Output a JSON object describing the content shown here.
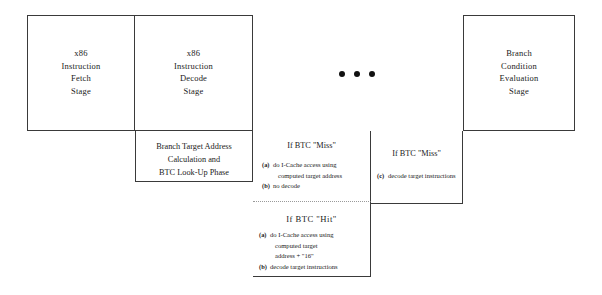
{
  "diagram": {
    "stroke_color": "#3a3a3a",
    "background_color": "#ffffff",
    "stages": [
      {
        "name": "fetch-stage",
        "lines": [
          "x86",
          "Instruction",
          "Fetch",
          "Stage"
        ]
      },
      {
        "name": "decode-stage",
        "lines": [
          "x86",
          "Instruction",
          "Decode",
          "Stage"
        ]
      },
      {
        "name": "branch-condition-evaluation-stage",
        "lines": [
          "Branch",
          "Condition",
          "Evaluation",
          "Stage"
        ]
      }
    ],
    "ellipsis": {
      "label": "continuation-dots",
      "dot_count": 3
    },
    "phase_box": {
      "lines": [
        "Branch Target Address",
        "Calculation and",
        "BTC Look-Up Phase"
      ]
    },
    "btc_miss_decode": {
      "title": "If BTC \"Miss\"",
      "items": [
        {
          "marker": "(a)",
          "lines": [
            "do I-Cache access using",
            "computed target address"
          ]
        },
        {
          "marker": "(b)",
          "lines": [
            "no decode"
          ]
        }
      ]
    },
    "btc_hit": {
      "title": "If BTC   \"Hit\"",
      "items": [
        {
          "marker": "(a)",
          "lines": [
            "do I-Cache access using",
            "computed target",
            "address + \"16\""
          ]
        },
        {
          "marker": "(b)",
          "lines": [
            "decode target instructions"
          ]
        }
      ]
    },
    "btc_miss_later": {
      "title": "If BTC \"Miss\"",
      "items": [
        {
          "marker": "(c)",
          "lines": [
            "decode target instructions"
          ]
        }
      ]
    }
  }
}
